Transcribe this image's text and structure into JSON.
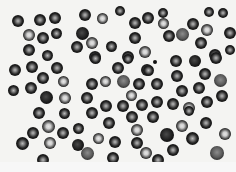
{
  "image": {
    "description": "Grayscale light micrograph of a blood smear showing red blood cells",
    "background_color": "#f4f4f2",
    "cell_rim_color": "#151515",
    "cell_center_color": "#8a8a8a"
  },
  "cells": [
    {
      "x": 18,
      "y": 21,
      "r": 6,
      "t": "n"
    },
    {
      "x": 40,
      "y": 20,
      "r": 6,
      "t": "n"
    },
    {
      "x": 55,
      "y": 18,
      "r": 6,
      "t": "n"
    },
    {
      "x": 29,
      "y": 35,
      "r": 6,
      "t": "light"
    },
    {
      "x": 43,
      "y": 38,
      "r": 6,
      "t": "n"
    },
    {
      "x": 56,
      "y": 33,
      "r": 5.5,
      "t": "n"
    },
    {
      "x": 29,
      "y": 50,
      "r": 6,
      "t": "n"
    },
    {
      "x": 47,
      "y": 55,
      "r": 5.5,
      "t": "n"
    },
    {
      "x": 77,
      "y": 47,
      "r": 6,
      "t": "n"
    },
    {
      "x": 85,
      "y": 15,
      "r": 6,
      "t": "n"
    },
    {
      "x": 102,
      "y": 18,
      "r": 5.5,
      "t": "light"
    },
    {
      "x": 120,
      "y": 11,
      "r": 5,
      "t": "n"
    },
    {
      "x": 82,
      "y": 33,
      "r": 6.5,
      "t": "dark"
    },
    {
      "x": 92,
      "y": 43,
      "r": 6,
      "t": "light"
    },
    {
      "x": 111,
      "y": 46,
      "r": 5.5,
      "t": "n"
    },
    {
      "x": 95,
      "y": 57,
      "r": 6,
      "t": "n"
    },
    {
      "x": 128,
      "y": 57,
      "r": 6,
      "t": "n"
    },
    {
      "x": 135,
      "y": 23,
      "r": 6,
      "t": "n"
    },
    {
      "x": 148,
      "y": 18,
      "r": 6,
      "t": "n"
    },
    {
      "x": 163,
      "y": 13,
      "r": 5,
      "t": "n"
    },
    {
      "x": 163,
      "y": 23,
      "r": 5.5,
      "t": "light"
    },
    {
      "x": 135,
      "y": 38,
      "r": 6,
      "t": "n"
    },
    {
      "x": 169,
      "y": 36,
      "r": 6,
      "t": "n"
    },
    {
      "x": 182,
      "y": 34,
      "r": 6.5,
      "t": "gray"
    },
    {
      "x": 193,
      "y": 24,
      "r": 6,
      "t": "n"
    },
    {
      "x": 207,
      "y": 30,
      "r": 6,
      "t": "light"
    },
    {
      "x": 209,
      "y": 12,
      "r": 5,
      "t": "n"
    },
    {
      "x": 223,
      "y": 13,
      "r": 5,
      "t": "n"
    },
    {
      "x": 201,
      "y": 43,
      "r": 6,
      "t": "n"
    },
    {
      "x": 145,
      "y": 52,
      "r": 6,
      "t": "light"
    },
    {
      "x": 230,
      "y": 33,
      "r": 6,
      "t": "n"
    },
    {
      "x": 230,
      "y": 50,
      "r": 5,
      "t": "n"
    },
    {
      "x": 215,
      "y": 55,
      "r": 6,
      "t": "n"
    },
    {
      "x": 15,
      "y": 70,
      "r": 6,
      "t": "n"
    },
    {
      "x": 32,
      "y": 67,
      "r": 6,
      "t": "n"
    },
    {
      "x": 57,
      "y": 68,
      "r": 6,
      "t": "n"
    },
    {
      "x": 43,
      "y": 78,
      "r": 6,
      "t": "n"
    },
    {
      "x": 63,
      "y": 81,
      "r": 5.5,
      "t": "light"
    },
    {
      "x": 13,
      "y": 90,
      "r": 5.5,
      "t": "n"
    },
    {
      "x": 31,
      "y": 88,
      "r": 6,
      "t": "n"
    },
    {
      "x": 46,
      "y": 97,
      "r": 6.5,
      "t": "dark"
    },
    {
      "x": 65,
      "y": 98,
      "r": 6,
      "t": "light"
    },
    {
      "x": 95,
      "y": 58,
      "r": 5.5,
      "t": "n"
    },
    {
      "x": 128,
      "y": 59,
      "r": 5,
      "t": "n"
    },
    {
      "x": 118,
      "y": 68,
      "r": 6,
      "t": "n"
    },
    {
      "x": 92,
      "y": 84,
      "r": 6,
      "t": "n"
    },
    {
      "x": 105,
      "y": 81,
      "r": 5.5,
      "t": "light"
    },
    {
      "x": 123,
      "y": 81,
      "r": 6.5,
      "t": "gray"
    },
    {
      "x": 139,
      "y": 84,
      "r": 6,
      "t": "n"
    },
    {
      "x": 147,
      "y": 70,
      "r": 6,
      "t": "n"
    },
    {
      "x": 87,
      "y": 98,
      "r": 6,
      "t": "n"
    },
    {
      "x": 131,
      "y": 95,
      "r": 5.5,
      "t": "light"
    },
    {
      "x": 106,
      "y": 106,
      "r": 6,
      "t": "n"
    },
    {
      "x": 123,
      "y": 106,
      "r": 6,
      "t": "n"
    },
    {
      "x": 142,
      "y": 105,
      "r": 6,
      "t": "n"
    },
    {
      "x": 176,
      "y": 61,
      "r": 6,
      "t": "n"
    },
    {
      "x": 195,
      "y": 61,
      "r": 6,
      "t": "dark"
    },
    {
      "x": 216,
      "y": 58,
      "r": 6,
      "t": "n"
    },
    {
      "x": 148,
      "y": 70,
      "r": 5.5,
      "t": "n"
    },
    {
      "x": 177,
      "y": 76,
      "r": 6,
      "t": "n"
    },
    {
      "x": 205,
      "y": 74,
      "r": 6,
      "t": "n"
    },
    {
      "x": 220,
      "y": 80,
      "r": 6.5,
      "t": "gray"
    },
    {
      "x": 157,
      "y": 84,
      "r": 6,
      "t": "n"
    },
    {
      "x": 182,
      "y": 91,
      "r": 6,
      "t": "n"
    },
    {
      "x": 199,
      "y": 88,
      "r": 6,
      "t": "n"
    },
    {
      "x": 222,
      "y": 96,
      "r": 6,
      "t": "n"
    },
    {
      "x": 157,
      "y": 102,
      "r": 6,
      "t": "n"
    },
    {
      "x": 173,
      "y": 104,
      "r": 6,
      "t": "n"
    },
    {
      "x": 189,
      "y": 108,
      "r": 6,
      "t": "light"
    },
    {
      "x": 207,
      "y": 102,
      "r": 6,
      "t": "n"
    },
    {
      "x": 39,
      "y": 113,
      "r": 6,
      "t": "n"
    },
    {
      "x": 64,
      "y": 113,
      "r": 5.5,
      "t": "n"
    },
    {
      "x": 48,
      "y": 126,
      "r": 6.5,
      "t": "light"
    },
    {
      "x": 33,
      "y": 133,
      "r": 6,
      "t": "n"
    },
    {
      "x": 63,
      "y": 133,
      "r": 6,
      "t": "n"
    },
    {
      "x": 22,
      "y": 143,
      "r": 6.5,
      "t": "n"
    },
    {
      "x": 50,
      "y": 143,
      "r": 6,
      "t": "light"
    },
    {
      "x": 43,
      "y": 160,
      "r": 6,
      "t": "n"
    },
    {
      "x": 78,
      "y": 128,
      "r": 5.5,
      "t": "n"
    },
    {
      "x": 92,
      "y": 113,
      "r": 6,
      "t": "n"
    },
    {
      "x": 109,
      "y": 123,
      "r": 6,
      "t": "n"
    },
    {
      "x": 132,
      "y": 117,
      "r": 6,
      "t": "n"
    },
    {
      "x": 78,
      "y": 145,
      "r": 6,
      "t": "dark"
    },
    {
      "x": 98,
      "y": 138,
      "r": 5.5,
      "t": "light"
    },
    {
      "x": 115,
      "y": 142,
      "r": 6,
      "t": "n"
    },
    {
      "x": 137,
      "y": 130,
      "r": 6,
      "t": "light"
    },
    {
      "x": 137,
      "y": 143,
      "r": 6,
      "t": "n"
    },
    {
      "x": 87,
      "y": 153,
      "r": 6.5,
      "t": "gray"
    },
    {
      "x": 113,
      "y": 158,
      "r": 6,
      "t": "n"
    },
    {
      "x": 146,
      "y": 153,
      "r": 6,
      "t": "light"
    },
    {
      "x": 153,
      "y": 117,
      "r": 6,
      "t": "n"
    },
    {
      "x": 189,
      "y": 111,
      "r": 5,
      "t": "n"
    },
    {
      "x": 182,
      "y": 126,
      "r": 6,
      "t": "light"
    },
    {
      "x": 206,
      "y": 123,
      "r": 6,
      "t": "n"
    },
    {
      "x": 167,
      "y": 135,
      "r": 7,
      "t": "dark"
    },
    {
      "x": 192,
      "y": 138,
      "r": 6.5,
      "t": "n"
    },
    {
      "x": 225,
      "y": 134,
      "r": 6,
      "t": "light"
    },
    {
      "x": 173,
      "y": 150,
      "r": 6,
      "t": "n"
    },
    {
      "x": 217,
      "y": 153,
      "r": 7,
      "t": "gray"
    },
    {
      "x": 158,
      "y": 160,
      "r": 6,
      "t": "n"
    }
  ],
  "dots": [
    {
      "x": 155,
      "y": 62
    }
  ]
}
